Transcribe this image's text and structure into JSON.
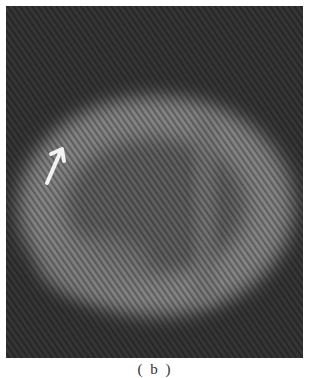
{
  "figure": {
    "caption": "( b )",
    "colors": {
      "background": "#3a3a3a",
      "ring": "#8a8a8a",
      "interior": "#5a5a5a",
      "arrow": "#f2f2f2"
    },
    "annotation": {
      "type": "arrow",
      "label": "arrow-pointing-up-right"
    }
  }
}
